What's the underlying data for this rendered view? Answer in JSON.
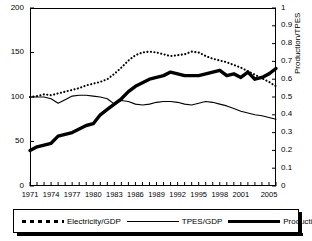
{
  "chart_data": {
    "type": "line",
    "title": "",
    "xlabel": "",
    "ylabel": "1971=100",
    "ylabel_secondary": "Production/TPES",
    "grid": false,
    "legend_position": "bottom",
    "xlim": [
      1971,
      2006
    ],
    "ylim": [
      0,
      200
    ],
    "ylim_secondary": [
      0,
      1
    ],
    "x": [
      1971,
      1972,
      1973,
      1974,
      1975,
      1976,
      1977,
      1978,
      1979,
      1980,
      1981,
      1982,
      1983,
      1984,
      1985,
      1986,
      1987,
      1988,
      1989,
      1990,
      1991,
      1992,
      1993,
      1994,
      1995,
      1996,
      1997,
      1998,
      1999,
      2000,
      2001,
      2002,
      2003,
      2004,
      2005,
      2006
    ],
    "xticks": [
      1971,
      1974,
      1977,
      1980,
      1983,
      1986,
      1989,
      1992,
      1995,
      1998,
      2001,
      2005
    ],
    "xtick_labels": [
      "1971",
      "1974",
      "1977",
      "1980",
      "1983",
      "1986",
      "1989",
      "1992",
      "1995",
      "1998",
      "2001",
      "2005"
    ],
    "yticks": [
      0,
      50,
      100,
      150,
      200
    ],
    "ytick_labels": [
      "0",
      "50",
      "100",
      "150",
      "200"
    ],
    "yticks_secondary": [
      0,
      0.1,
      0.2,
      0.3,
      0.4,
      0.5,
      0.6,
      0.7,
      0.8,
      0.9,
      1
    ],
    "ytick_labels_secondary": [
      "0",
      "0.1",
      "0.2",
      "0.3",
      "0.4",
      "0.5",
      "0.6",
      "0.7",
      "0.8",
      "0.9",
      "1"
    ],
    "series": [
      {
        "name": "Electricity/GDP",
        "style": "dotted",
        "axis": "left",
        "values": [
          100,
          101,
          103,
          102,
          104,
          106,
          108,
          110,
          113,
          115,
          117,
          120,
          126,
          133,
          141,
          147,
          150,
          151,
          150,
          148,
          146,
          147,
          148,
          151,
          150,
          146,
          143,
          141,
          139,
          136,
          133,
          129,
          125,
          121,
          117,
          112
        ]
      },
      {
        "name": "TPES/GDP",
        "style": "thin",
        "axis": "left",
        "values": [
          100,
          100,
          100,
          98,
          93,
          97,
          101,
          102,
          102,
          101,
          100,
          98,
          92,
          96,
          95,
          92,
          91,
          92,
          94,
          95,
          95,
          94,
          92,
          91,
          93,
          95,
          94,
          92,
          90,
          87,
          84,
          82,
          80,
          79,
          77,
          75
        ]
      },
      {
        "name": "Production/TPES",
        "style": "thick",
        "axis": "right",
        "values": [
          0.2,
          0.22,
          0.23,
          0.24,
          0.28,
          0.29,
          0.3,
          0.32,
          0.34,
          0.35,
          0.4,
          0.43,
          0.46,
          0.49,
          0.53,
          0.56,
          0.58,
          0.6,
          0.61,
          0.62,
          0.64,
          0.63,
          0.62,
          0.62,
          0.62,
          0.63,
          0.64,
          0.65,
          0.62,
          0.63,
          0.61,
          0.64,
          0.6,
          0.61,
          0.63,
          0.66
        ]
      }
    ],
    "legend": [
      {
        "label": "Electricity/GDP",
        "style": "dotted"
      },
      {
        "label": "TPES/GDP",
        "style": "thin"
      },
      {
        "label": "Production/TPES",
        "style": "thick"
      }
    ]
  }
}
